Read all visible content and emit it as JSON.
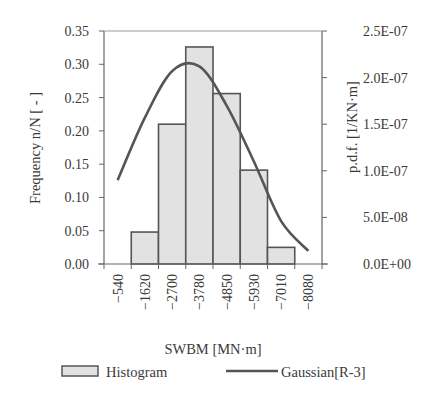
{
  "chart_data": {
    "type": "bar",
    "title": "",
    "xlabel": "SWBM [MN·m]",
    "ylabel": "Frequency  n/N  [ - ]",
    "y2label": "p.d.f.  [1/KN·m]",
    "categories": [
      "-540",
      "-1620",
      "-2700",
      "-3780",
      "-4850",
      "-5930",
      "-7010",
      "-8080"
    ],
    "ylim": [
      0,
      0.35
    ],
    "yticks": [
      "0.00",
      "0.05",
      "0.10",
      "0.15",
      "0.20",
      "0.25",
      "0.30",
      "0.35"
    ],
    "y2lim": [
      0,
      2.5e-07
    ],
    "y2ticks": [
      "0.0E+00",
      "5.0E-08",
      "1.0E-07",
      "1.5E-07",
      "2.0E-07",
      "2.5E-07"
    ],
    "grid": false,
    "legend_position": "bottom",
    "series": [
      {
        "name": "Histogram",
        "type": "bar",
        "axis": "left",
        "color": "#e2e2e2",
        "values": [
          0,
          0.048,
          0.21,
          0.326,
          0.256,
          0.141,
          0.025,
          0
        ]
      },
      {
        "name": "Gaussian[R-3]",
        "type": "line",
        "axis": "right",
        "color": "#555555",
        "values": [
          9e-08,
          1.57e-07,
          2.07e-07,
          2.12e-07,
          1.7e-07,
          1.1e-07,
          4.6e-08,
          1.4e-08
        ]
      }
    ]
  }
}
